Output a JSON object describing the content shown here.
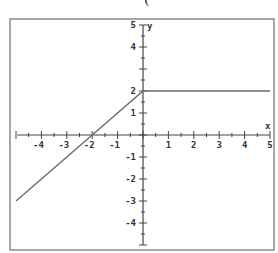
{
  "top_fragment": "(",
  "chart_data": {
    "type": "line",
    "title": "",
    "xlabel": "x",
    "ylabel": "y",
    "xlim": [
      -5,
      5
    ],
    "ylim": [
      -5,
      5
    ],
    "grid": false,
    "legend": null,
    "x_ticks": [
      -4,
      -3,
      -2,
      -1,
      1,
      2,
      3,
      4,
      5
    ],
    "y_ticks": [
      5,
      4,
      2,
      1,
      -1,
      -2,
      -3,
      -4
    ],
    "series": [
      {
        "name": "f(x)",
        "description": "piecewise: y = x + 2 for x <= 0; y = 2 for x > 0",
        "x": [
          -5,
          -2,
          0,
          5
        ],
        "y": [
          -3,
          0,
          2,
          2
        ]
      }
    ]
  },
  "style": {
    "frame_color": "#8a8a8a",
    "axis_color": "#444444",
    "line_color": "#6a6a6a"
  }
}
